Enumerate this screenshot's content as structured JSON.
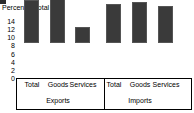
{
  "chart_data": {
    "type": "bar",
    "title": "Percent of total",
    "xlabel": "",
    "ylabel": "Percent of total",
    "ylim": [
      0,
      14
    ],
    "yticks": [
      0,
      2,
      4,
      6,
      8,
      10,
      12,
      14
    ],
    "grid": false,
    "legend": null,
    "groups": [
      {
        "name": "Exports",
        "categories": [
          "Total",
          "Goods",
          "Services"
        ],
        "values": [
          10.5,
          12.7,
          3.9
        ]
      },
      {
        "name": "Imports",
        "categories": [
          "Total",
          "Goods",
          "Services"
        ],
        "values": [
          9.7,
          10.1,
          9.0
        ]
      }
    ],
    "categories": [
      "Total",
      "Goods",
      "Services",
      "Total",
      "Goods",
      "Services"
    ],
    "values": [
      10.5,
      12.7,
      3.9,
      9.7,
      10.1,
      9.0
    ],
    "bar_color": "#3a3a3a",
    "axis_color": "#000000",
    "background": "#ffffff"
  }
}
